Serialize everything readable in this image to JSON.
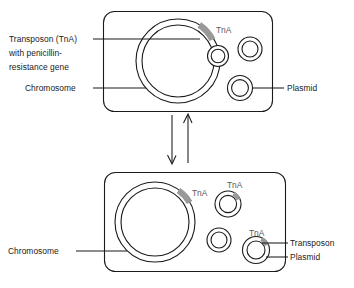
{
  "figure": {
    "background_color": "#ffffff",
    "line_color": "#1a1a1a",
    "transposon_color": "#999999"
  },
  "top_cell": {
    "name": "bacterial cell before transposition",
    "chromosome": {
      "label": "Chromosome",
      "transposon_label": "TnA",
      "transposon_present": true
    },
    "chromosome_callout": {
      "line1": "Transposon (TnA)",
      "line2": "with penicillin-",
      "line3": "resistance gene"
    },
    "plasmid_label": "Plasmid",
    "plasmids": [
      {
        "name": "plasmid-1",
        "has_transposon": false,
        "transposon_label": ""
      },
      {
        "name": "plasmid-2",
        "has_transposon": false,
        "transposon_label": ""
      },
      {
        "name": "plasmid-3",
        "has_transposon": false,
        "transposon_label": ""
      }
    ]
  },
  "flow": {
    "down_arrow": "transposition downward",
    "up_arrow": "transposition upward"
  },
  "bottom_cell": {
    "name": "bacterial cell after transposition",
    "chromosome": {
      "label": "Chromosome",
      "transposon_label": "TnA",
      "transposon_present": true
    },
    "plasmid_label": "Plasmid",
    "transposon_label": "Transposon",
    "plasmids": [
      {
        "name": "plasmid-1",
        "has_transposon": true,
        "transposon_label": "TnA"
      },
      {
        "name": "plasmid-2",
        "has_transposon": false,
        "transposon_label": ""
      },
      {
        "name": "plasmid-3",
        "has_transposon": true,
        "transposon_label": "TnA"
      }
    ]
  }
}
